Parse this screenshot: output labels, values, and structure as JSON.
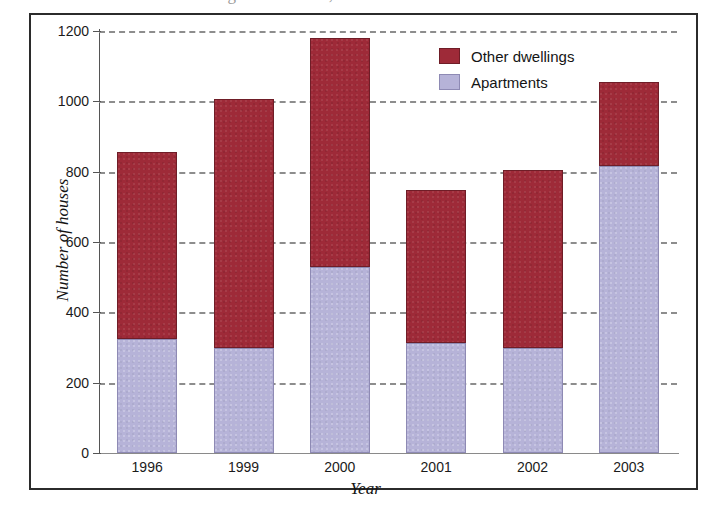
{
  "page": {
    "top_cut_text": "of dwellings in the area, 1996 to 2003"
  },
  "chart_data": {
    "type": "bar",
    "subtype": "stacked-vertical",
    "title": "",
    "xlabel": "Year",
    "ylabel": "Number of houses",
    "categories": [
      "1996",
      "1999",
      "2000",
      "2001",
      "2002",
      "2003"
    ],
    "series": [
      {
        "name": "Apartments",
        "color": "#b6b3d8",
        "values": [
          325,
          300,
          530,
          312,
          300,
          815
        ]
      },
      {
        "name": "Other dwellings",
        "color": "#9e2a38",
        "values": [
          530,
          708,
          650,
          437,
          505,
          240
        ]
      }
    ],
    "totals": [
      855,
      1008,
      1180,
      749,
      805,
      1055
    ],
    "ylim": [
      0,
      1200
    ],
    "yticks": [
      0,
      200,
      400,
      600,
      800,
      1000,
      1200
    ],
    "ytick_labels": [
      "0",
      "200",
      "400",
      "600",
      "800",
      "1000",
      "1200"
    ],
    "grid": "horizontal-dashed",
    "legend_position": "top-right",
    "legend_order": [
      "Other dwellings",
      "Apartments"
    ]
  },
  "legend": {
    "items": [
      {
        "label": "Other dwellings",
        "swatch": "dark-red"
      },
      {
        "label": "Apartments",
        "swatch": "lavender"
      }
    ]
  }
}
